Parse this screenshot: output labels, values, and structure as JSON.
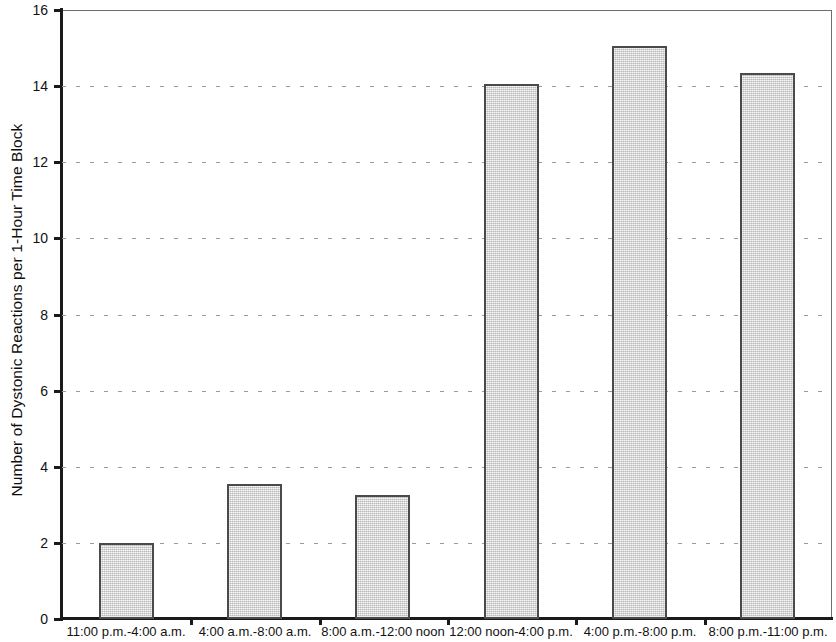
{
  "chart_data": {
    "type": "bar",
    "title": "",
    "xlabel": "",
    "ylabel": "Number of Dystonic Reactions per 1-Hour Time Block",
    "ylim": [
      0,
      16
    ],
    "ytick_labels": [
      "0",
      "2",
      "4",
      "6",
      "8",
      "10",
      "12",
      "14",
      "16"
    ],
    "yticks": [
      0,
      2,
      4,
      6,
      8,
      10,
      12,
      14,
      16
    ],
    "grid": true,
    "legend": null,
    "categories": [
      "11:00 p.m.-4:00 a.m.",
      "4:00 a.m.-8:00 a.m.",
      "8:00 a.m.-12:00 noon",
      "12:00 noon-4:00 p.m.",
      "4:00 p.m.-8:00 p.m.",
      "8:00 p.m.-11:00 p.m."
    ],
    "values": [
      2.0,
      3.55,
      3.25,
      14.05,
      15.05,
      14.35
    ],
    "bar_color": "#d2d2d2",
    "bar_edge_color": "#4a4a4a",
    "axis_color": "#1a1a1a",
    "gridline_color": "#9a9a9a",
    "background_color": "#ffffff"
  }
}
